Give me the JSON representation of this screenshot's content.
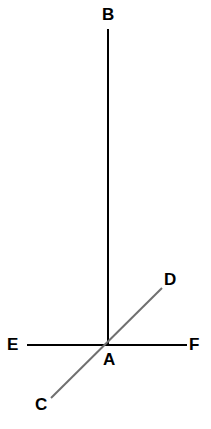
{
  "figure": {
    "type": "geometry-line-diagram",
    "width": 211,
    "height": 429,
    "background_color": "#ffffff"
  },
  "labels": {
    "B": "B",
    "D": "D",
    "E": "E",
    "A": "A",
    "F": "F",
    "C": "C"
  },
  "points": {
    "A": {
      "name": "A",
      "x": 108,
      "y": 345,
      "role": "intersection-vertex"
    },
    "B": {
      "name": "B",
      "x": 108,
      "y": 29,
      "role": "ray-endpoint"
    },
    "C": {
      "name": "C",
      "x": 51,
      "y": 398,
      "role": "ray-endpoint"
    },
    "D": {
      "name": "D",
      "x": 162,
      "y": 288,
      "role": "ray-endpoint"
    },
    "E": {
      "name": "E",
      "x": 27,
      "y": 345,
      "role": "ray-endpoint"
    },
    "F": {
      "name": "F",
      "x": 187,
      "y": 345,
      "role": "ray-endpoint"
    }
  },
  "segments": [
    {
      "name": "AB",
      "from": "A",
      "to": "B",
      "x1": 108,
      "y1": 345,
      "x2": 108,
      "y2": 29,
      "color": "#000000",
      "stroke_width": 2
    },
    {
      "name": "EF",
      "from": "E",
      "to": "F",
      "x1": 27,
      "y1": 345,
      "x2": 187,
      "y2": 345,
      "color": "#000000",
      "stroke_width": 2
    },
    {
      "name": "CD",
      "from": "C",
      "to": "D",
      "x1": 51,
      "y1": 398,
      "x2": 162,
      "y2": 288,
      "color": "#707070",
      "stroke_width": 2
    }
  ],
  "colors": {
    "line_black": "#000000",
    "line_gray": "#707070",
    "label_text": "#000000",
    "background": "#ffffff"
  }
}
